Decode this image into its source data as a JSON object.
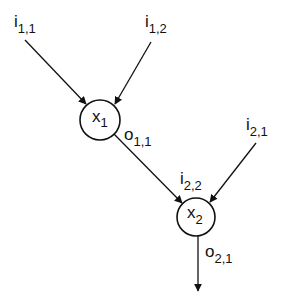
{
  "diagram": {
    "colors": {
      "ink": "#111111",
      "background": "#ffffff"
    },
    "nodes": [
      {
        "id": "x1",
        "label_main": "x",
        "label_sub": "1",
        "cx": 100,
        "cy": 120,
        "r": 20
      },
      {
        "id": "x2",
        "label_main": "x",
        "label_sub": "2",
        "cx": 196,
        "cy": 217,
        "r": 19
      }
    ],
    "labels": {
      "i11": {
        "main": "i",
        "sub": "1,1"
      },
      "i12": {
        "main": "i",
        "sub": "1,2"
      },
      "i21": {
        "main": "i",
        "sub": "2,1"
      },
      "i22": {
        "main": "i",
        "sub": "2,2"
      },
      "o11": {
        "main": "o",
        "sub": "1,1"
      },
      "o21": {
        "main": "o",
        "sub": "2,1"
      }
    },
    "edges": [
      {
        "from": "i11",
        "to": "x1",
        "arrow": "end"
      },
      {
        "from": "i12",
        "to": "x1",
        "arrow": "end"
      },
      {
        "from": "x1",
        "to": "x2",
        "label_from": "o11",
        "label_to": "i22",
        "arrow": "end"
      },
      {
        "from": "i21",
        "to": "x2",
        "arrow": "end"
      },
      {
        "from": "x2",
        "to": "output",
        "label": "o21",
        "arrow": "end"
      }
    ]
  }
}
